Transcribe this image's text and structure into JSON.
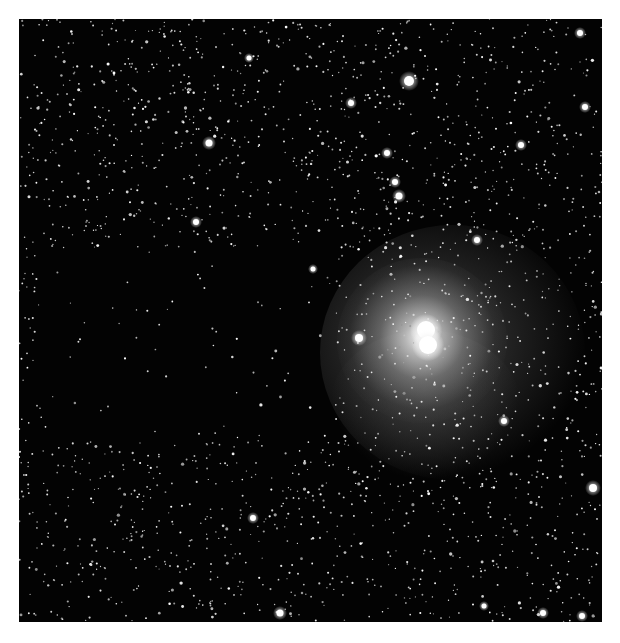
{
  "image": {
    "kind": "astronomical grayscale star field with reflection nebula",
    "background_color": "#030303",
    "frame": {
      "x": 19,
      "y": 19,
      "width": 583,
      "height": 603
    }
  },
  "nebula": {
    "center": [
      422,
      338
    ],
    "core_color": "#ffffff",
    "glow_color": "#9a9a9a",
    "halo_color": "#3a3a3a",
    "extent": {
      "x0": 320,
      "y0": 225,
      "x1": 585,
      "y1": 480
    },
    "cores": [
      {
        "x": 426,
        "y": 330,
        "r": 9
      },
      {
        "x": 428,
        "y": 345,
        "r": 9
      }
    ]
  },
  "dark_lane": {
    "x0": 40,
    "y0": 250,
    "x1": 330,
    "y1": 440
  },
  "bright_stars": [
    {
      "x": 409,
      "y": 81,
      "r": 5
    },
    {
      "x": 359,
      "y": 338,
      "r": 4
    },
    {
      "x": 351,
      "y": 103,
      "r": 3
    },
    {
      "x": 387,
      "y": 153,
      "r": 3
    },
    {
      "x": 395,
      "y": 182,
      "r": 3
    },
    {
      "x": 399,
      "y": 196,
      "r": 3.5
    },
    {
      "x": 521,
      "y": 145,
      "r": 3
    },
    {
      "x": 477,
      "y": 240,
      "r": 3
    },
    {
      "x": 209,
      "y": 143,
      "r": 3.5
    },
    {
      "x": 249,
      "y": 58,
      "r": 2.5
    },
    {
      "x": 196,
      "y": 222,
      "r": 3
    },
    {
      "x": 313,
      "y": 269,
      "r": 2.5
    },
    {
      "x": 580,
      "y": 33,
      "r": 3
    },
    {
      "x": 585,
      "y": 107,
      "r": 3
    },
    {
      "x": 593,
      "y": 488,
      "r": 4
    },
    {
      "x": 504,
      "y": 421,
      "r": 3
    },
    {
      "x": 280,
      "y": 613,
      "r": 3.5
    },
    {
      "x": 253,
      "y": 518,
      "r": 3
    },
    {
      "x": 543,
      "y": 613,
      "r": 3
    },
    {
      "x": 582,
      "y": 616,
      "r": 3
    },
    {
      "x": 484,
      "y": 606,
      "r": 2.5
    }
  ],
  "faint_star_count": 2600,
  "seed": 7
}
